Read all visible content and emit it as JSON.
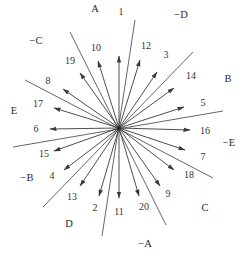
{
  "diagram": {
    "title": "",
    "center": [
      119,
      128
    ],
    "colors": {
      "line": "#555555",
      "arrow": "#3a3a3a",
      "text": "#333333",
      "background": "#ffffff"
    },
    "axis_lines": [
      {
        "name": "A",
        "end": [
          70,
          32
        ],
        "neg_name": "-A",
        "neg_end": [
          166,
          225
        ]
      },
      {
        "name": "D-axis-top",
        "end": [
          135,
          20
        ],
        "neg_end": [
          102,
          236
        ]
      },
      {
        "name": "E-axis",
        "end": [
          25,
          80
        ],
        "neg_end": [
          213,
          178
        ]
      },
      {
        "name": "B-axis",
        "end": [
          193,
          52
        ],
        "neg_end": [
          43,
          207
        ]
      },
      {
        "name": "C-axis",
        "end": [
          223,
          111
        ],
        "neg_end": [
          13,
          147
        ]
      }
    ],
    "axis_labels": [
      {
        "id": "A",
        "text": "A",
        "pos": [
          95,
          9
        ]
      },
      {
        "id": "neg-D",
        "text": "−D",
        "pos": [
          181,
          15
        ]
      },
      {
        "id": "neg-C",
        "text": "−C",
        "pos": [
          36,
          41
        ]
      },
      {
        "id": "B",
        "text": "B",
        "pos": [
          228,
          79
        ]
      },
      {
        "id": "E",
        "text": "E",
        "pos": [
          14,
          111
        ]
      },
      {
        "id": "neg-E",
        "text": "−E",
        "pos": [
          229,
          143
        ]
      },
      {
        "id": "neg-B",
        "text": "−B",
        "pos": [
          27,
          178
        ]
      },
      {
        "id": "C",
        "text": "C",
        "pos": [
          205,
          208
        ]
      },
      {
        "id": "D",
        "text": "D",
        "pos": [
          69,
          224
        ]
      },
      {
        "id": "neg-A",
        "text": "−A",
        "pos": [
          145,
          244
        ]
      }
    ],
    "arrows": [
      {
        "id": "1",
        "text": "1",
        "tip": [
          119,
          56
        ],
        "label_pos": [
          121,
          12
        ]
      },
      {
        "id": "12",
        "text": "12",
        "tip": [
          140,
          60
        ],
        "label_pos": [
          146,
          46
        ]
      },
      {
        "id": "3",
        "text": "3",
        "tip": [
          157,
          72
        ],
        "label_pos": [
          166,
          55
        ]
      },
      {
        "id": "14",
        "text": "14",
        "tip": [
          174,
          88
        ],
        "label_pos": [
          191,
          76
        ]
      },
      {
        "id": "5",
        "text": "5",
        "tip": [
          184,
          107
        ],
        "label_pos": [
          203,
          103
        ]
      },
      {
        "id": "16",
        "text": "16",
        "tip": [
          190,
          130
        ],
        "label_pos": [
          205,
          131
        ]
      },
      {
        "id": "7",
        "text": "7",
        "tip": [
          185,
          150
        ],
        "label_pos": [
          203,
          157
        ]
      },
      {
        "id": "18",
        "text": "18",
        "tip": [
          174,
          170
        ],
        "label_pos": [
          189,
          175
        ]
      },
      {
        "id": "9",
        "text": "9",
        "tip": [
          160,
          186
        ],
        "label_pos": [
          168,
          194
        ]
      },
      {
        "id": "20",
        "text": "20",
        "tip": [
          139,
          196
        ],
        "label_pos": [
          144,
          207
        ]
      },
      {
        "id": "11",
        "text": "11",
        "tip": [
          119,
          198
        ],
        "label_pos": [
          119,
          212
        ]
      },
      {
        "id": "2",
        "text": "2",
        "tip": [
          99,
          196
        ],
        "label_pos": [
          95,
          208
        ]
      },
      {
        "id": "13",
        "text": "13",
        "tip": [
          80,
          186
        ],
        "label_pos": [
          72,
          197
        ]
      },
      {
        "id": "4",
        "text": "4",
        "tip": [
          64,
          170
        ],
        "label_pos": [
          52,
          176
        ]
      },
      {
        "id": "15",
        "text": "15",
        "tip": [
          54,
          151
        ],
        "label_pos": [
          44,
          154
        ]
      },
      {
        "id": "6",
        "text": "6",
        "tip": [
          50,
          129
        ],
        "label_pos": [
          36,
          129
        ]
      },
      {
        "id": "17",
        "text": "17",
        "tip": [
          54,
          108
        ],
        "label_pos": [
          38,
          104
        ]
      },
      {
        "id": "8",
        "text": "8",
        "tip": [
          63,
          89
        ],
        "label_pos": [
          48,
          81
        ]
      },
      {
        "id": "19",
        "text": "19",
        "tip": [
          80,
          73
        ],
        "label_pos": [
          70,
          61
        ]
      },
      {
        "id": "10",
        "text": "10",
        "tip": [
          98,
          61
        ],
        "label_pos": [
          96,
          48
        ]
      }
    ]
  }
}
